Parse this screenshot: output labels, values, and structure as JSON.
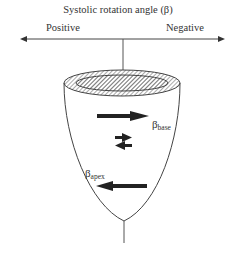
{
  "diagram": {
    "title": "Systolic rotation angle (β)",
    "axis": {
      "left_label": "Positive",
      "right_label": "Negative"
    },
    "labels": {
      "base": {
        "symbol": "β",
        "sub": "base"
      },
      "apex": {
        "symbol": "β",
        "sub": "apex"
      }
    },
    "arrows": [
      {
        "name": "base-rotation",
        "direction": "right"
      },
      {
        "name": "mid-right",
        "direction": "right"
      },
      {
        "name": "mid-left",
        "direction": "left"
      },
      {
        "name": "apex-rotation",
        "direction": "left"
      }
    ]
  }
}
